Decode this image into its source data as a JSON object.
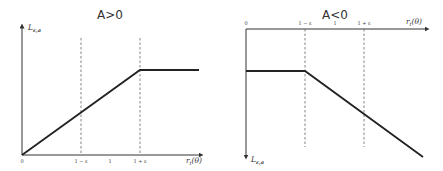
{
  "diagrams": [
    {
      "title": "A>0",
      "y_axis_label": "L_{ε,a}",
      "y_axis_label_text": "L",
      "y_axis_label_sub": "ε,a",
      "x_axis_label_text": "r",
      "x_axis_label_sub": "t",
      "x_axis_label_tail": "(θ)",
      "ticks": [
        "0",
        "1 − ε",
        "1",
        "1 + ε"
      ],
      "description": "Increasing linear from origin until 1+ε, then constant"
    },
    {
      "title": "A<0",
      "y_axis_label": "L_{ε,a}",
      "y_axis_label_text": "L",
      "y_axis_label_sub": "ε,a",
      "x_axis_label_text": "r",
      "x_axis_label_sub": "t",
      "x_axis_label_tail": "(θ)",
      "ticks": [
        "0",
        "1 − ε",
        "1",
        "1 + ε"
      ],
      "description": "Constant until 1−ε, then decreasing linearly"
    }
  ],
  "colors": {
    "line": "#222222",
    "axis": "#333333",
    "dashed": "#666666",
    "background": "#ffffff"
  }
}
